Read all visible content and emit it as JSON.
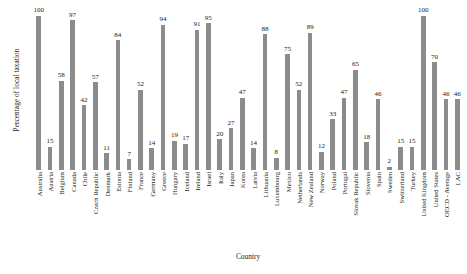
{
  "chart_data": {
    "type": "bar",
    "title": "",
    "xlabel": "Country",
    "ylabel": "Percentage of local taxation",
    "ylim": [
      0,
      105
    ],
    "grid": false,
    "legend": null,
    "bar_color": "#8c8c8c",
    "categories": [
      "Australia",
      "Austria",
      "Belgium",
      "Canada",
      "Chile",
      "Czech Republic",
      "Denmark",
      "Estonia",
      "Finland",
      "France",
      "Germany",
      "Greece",
      "Hungary",
      "Iceland",
      "Ireland",
      "Israel",
      "Italy",
      "Japan",
      "Korea",
      "Latvia",
      "Lithuania",
      "Luxembourg",
      "Mexico",
      "Netherlands",
      "New Zealand",
      "Norway",
      "Poland",
      "Portugal",
      "Slovak Republic",
      "Slovenia",
      "Spain",
      "Sweden",
      "Switzerland",
      "Turkey",
      "United Kingdom",
      "United States",
      "OECD - Average",
      "LAC"
    ],
    "values": [
      100,
      15,
      58,
      97,
      42,
      57,
      11,
      84,
      7,
      52,
      14,
      94,
      19,
      17,
      91,
      95,
      20,
      27,
      47,
      14,
      88,
      8,
      75,
      52,
      89,
      12,
      33,
      47,
      65,
      18,
      46,
      2,
      15,
      15,
      100,
      70,
      46,
      46
    ]
  }
}
